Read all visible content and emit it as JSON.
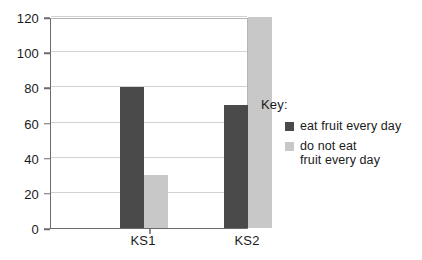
{
  "chart_data": {
    "type": "bar",
    "title": "",
    "xlabel": "",
    "ylabel": "",
    "categories": [
      "KS1",
      "KS2"
    ],
    "series": [
      {
        "name": "eat fruit every day",
        "values": [
          80,
          70
        ],
        "color": "#4a4a4a"
      },
      {
        "name": "do not eat fruit every day",
        "values": [
          30,
          120
        ],
        "color": "#c8c8c8"
      }
    ],
    "ylim": [
      0,
      120
    ],
    "yticks": [
      0,
      20,
      40,
      60,
      80,
      100,
      120
    ],
    "ytick_labels": [
      "0",
      "20",
      "40",
      "60",
      "80",
      "100",
      "120"
    ],
    "grid": true,
    "legend_position": "right"
  },
  "legend": {
    "title": "Key:",
    "items": [
      {
        "label": "eat fruit every day",
        "color": "#4a4a4a"
      },
      {
        "label": "do not eat\nfruit every day",
        "color": "#c8c8c8"
      }
    ]
  },
  "colors": {
    "series_dark": "#4a4a4a",
    "series_light": "#c8c8c8",
    "gridline": "#d2d2d2",
    "axis": "#6b6b6b",
    "text": "#1a1a1a",
    "background": "#ffffff"
  }
}
